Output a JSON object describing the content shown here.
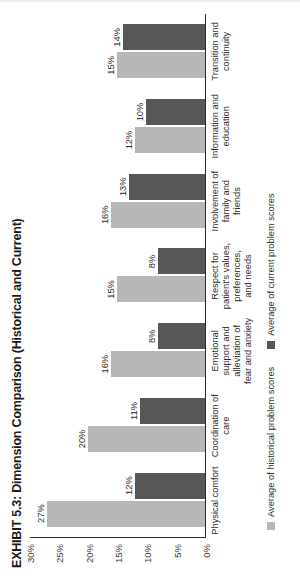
{
  "chart_data": {
    "type": "bar",
    "title": "EXHIBIT 5.3: Dimension Comparison (Historical and Current)",
    "xlabel": "",
    "ylabel": "",
    "ylim": [
      0,
      30
    ],
    "grid": false,
    "legend_position": "bottom-left",
    "ticks": [
      "30%",
      "25%",
      "20%",
      "15%",
      "10%",
      "5%",
      "0%"
    ],
    "tick_values": [
      30,
      25,
      20,
      15,
      10,
      5,
      0
    ],
    "categories": [
      "Physical comfort",
      "Coordination of care",
      "Emotional support and alleviation of fear and anxiety",
      "Respect for patient's values, preferences, and needs",
      "Involvement of family and friends",
      "Information and education",
      "Transition and continuity"
    ],
    "series": [
      {
        "name": "Average of historical problem scores",
        "color": "#b7b7b7",
        "values": [
          27,
          20,
          16,
          15,
          16,
          12,
          15
        ],
        "labels": [
          "27%",
          "20%",
          "16%",
          "15%",
          "16%",
          "12%",
          "15%"
        ]
      },
      {
        "name": "Average of current problem scores",
        "color": "#575757",
        "values": [
          12,
          11,
          8,
          8,
          13,
          10,
          14
        ],
        "labels": [
          "12%",
          "11%",
          "8%",
          "8%",
          "13%",
          "10%",
          "14%"
        ]
      }
    ]
  },
  "legend": {
    "items": [
      {
        "label": "Average of historical problem scores"
      },
      {
        "label": "Average of current problem scores"
      }
    ]
  }
}
